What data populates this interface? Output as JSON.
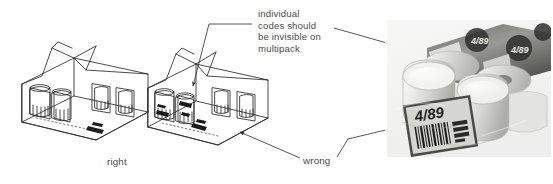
{
  "figure": {
    "background_color": "#ffffff",
    "width": 553,
    "height": 184
  },
  "annotations": {
    "note": "individual\ncodes should\nbe invisible on\nmultipack",
    "note_lines": [
      "individual",
      "codes should",
      "be invisible on",
      "multipack"
    ],
    "right_label": "right",
    "wrong_label": "wrong",
    "text_color": "#4c4c4c"
  },
  "illustrations": {
    "left": {
      "name": "correct-multipack-drawing",
      "caption": "right",
      "description": "line drawing of an open-window carton multipack of four containers with no individual codes visible"
    },
    "middle": {
      "name": "incorrect-multipack-drawing",
      "caption": "wrong",
      "description": "line drawing of the same carton multipack with dark individual barcodes visible on the containers"
    }
  },
  "photo": {
    "name": "multipack-photograph",
    "caption": "wrong",
    "label_text": "4/89",
    "description": "grayscale photograph of a shrink-wrapped multipack of cans showing a large barcode label on the outer wrap",
    "frame": {
      "x": 385,
      "y": 18,
      "width": 168,
      "height": 141
    }
  },
  "leaders": [
    {
      "name": "note-to-middle-drawing-leader",
      "from": "note",
      "to": "incorrect-multipack-drawing"
    },
    {
      "name": "note-to-photo-leader",
      "from": "note",
      "to": "multipack-photograph"
    },
    {
      "name": "wrong-to-middle-drawing-leader",
      "from": "wrong_label",
      "to": "incorrect-multipack-drawing"
    },
    {
      "name": "wrong-to-photo-leader",
      "from": "wrong_label",
      "to": "multipack-photograph"
    }
  ]
}
